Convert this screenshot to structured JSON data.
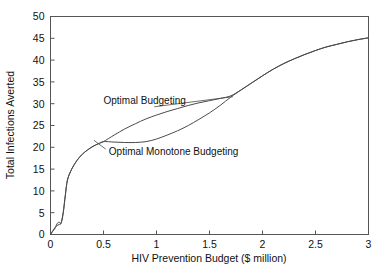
{
  "chart_data": {
    "type": "line",
    "title": "",
    "xlabel": "HIV Prevention Budget ($ million)",
    "ylabel": "Total Infections Averted",
    "xlim": [
      0,
      3
    ],
    "ylim": [
      0,
      50
    ],
    "xticks": [
      "0",
      "0.5",
      "1",
      "1.5",
      "2",
      "2.5",
      "3"
    ],
    "xtick_values": [
      0,
      0.5,
      1,
      1.5,
      2,
      2.5,
      3
    ],
    "yticks": [
      "0",
      "5",
      "10",
      "15",
      "20",
      "25",
      "30",
      "35",
      "40",
      "45",
      "50"
    ],
    "ytick_values": [
      0,
      5,
      10,
      15,
      20,
      25,
      30,
      35,
      40,
      45,
      50
    ],
    "grid": false,
    "legend": "annotations-inline",
    "series": [
      {
        "name": "Optimal Budgeting",
        "points": [
          [
            0.0,
            0.0
          ],
          [
            0.02,
            0.8
          ],
          [
            0.04,
            1.5
          ],
          [
            0.06,
            2.0
          ],
          [
            0.08,
            2.3
          ],
          [
            0.1,
            2.6
          ],
          [
            0.12,
            5.0
          ],
          [
            0.14,
            9.0
          ],
          [
            0.16,
            12.5
          ],
          [
            0.2,
            15.0
          ],
          [
            0.25,
            17.0
          ],
          [
            0.3,
            18.4
          ],
          [
            0.35,
            19.4
          ],
          [
            0.4,
            20.2
          ],
          [
            0.45,
            20.8
          ],
          [
            0.5,
            21.3
          ],
          [
            0.6,
            22.8
          ],
          [
            0.7,
            24.2
          ],
          [
            0.8,
            25.4
          ],
          [
            0.9,
            26.5
          ],
          [
            1.0,
            27.4
          ],
          [
            1.1,
            28.2
          ],
          [
            1.2,
            28.9
          ],
          [
            1.3,
            29.6
          ],
          [
            1.4,
            30.2
          ],
          [
            1.5,
            30.7
          ],
          [
            1.6,
            31.2
          ],
          [
            1.7,
            31.8
          ],
          [
            1.8,
            33.2
          ],
          [
            1.9,
            34.8
          ],
          [
            2.0,
            36.4
          ],
          [
            2.1,
            37.9
          ],
          [
            2.2,
            39.2
          ],
          [
            2.3,
            40.3
          ],
          [
            2.4,
            41.3
          ],
          [
            2.5,
            42.2
          ],
          [
            2.6,
            43.0
          ],
          [
            2.7,
            43.6
          ],
          [
            2.8,
            44.2
          ],
          [
            2.9,
            44.7
          ],
          [
            3.0,
            45.1
          ]
        ]
      },
      {
        "name": "Optimal Monotone Budgeting",
        "points": [
          [
            0.0,
            0.0
          ],
          [
            0.02,
            0.7
          ],
          [
            0.04,
            1.3
          ],
          [
            0.05,
            1.9
          ],
          [
            0.06,
            2.4
          ],
          [
            0.07,
            2.7
          ],
          [
            0.085,
            2.8
          ],
          [
            0.1,
            2.6
          ],
          [
            0.12,
            5.0
          ],
          [
            0.14,
            9.0
          ],
          [
            0.16,
            12.5
          ],
          [
            0.2,
            15.0
          ],
          [
            0.25,
            17.0
          ],
          [
            0.3,
            18.4
          ],
          [
            0.35,
            19.4
          ],
          [
            0.4,
            20.2
          ],
          [
            0.45,
            20.8
          ],
          [
            0.5,
            21.3
          ],
          [
            0.6,
            21.2
          ],
          [
            0.7,
            21.1
          ],
          [
            0.8,
            21.1
          ],
          [
            0.9,
            21.3
          ],
          [
            1.0,
            21.9
          ],
          [
            1.1,
            22.8
          ],
          [
            1.2,
            23.8
          ],
          [
            1.3,
            25.0
          ],
          [
            1.4,
            26.4
          ],
          [
            1.5,
            27.9
          ],
          [
            1.6,
            29.6
          ],
          [
            1.7,
            31.5
          ],
          [
            1.8,
            33.2
          ],
          [
            1.9,
            34.8
          ],
          [
            2.0,
            36.4
          ],
          [
            2.1,
            37.9
          ],
          [
            2.2,
            39.2
          ],
          [
            2.3,
            40.3
          ],
          [
            2.4,
            41.3
          ],
          [
            2.5,
            42.2
          ],
          [
            2.6,
            43.0
          ],
          [
            2.7,
            43.6
          ],
          [
            2.8,
            44.2
          ],
          [
            2.9,
            44.7
          ],
          [
            3.0,
            45.1
          ]
        ]
      }
    ],
    "annotations": [
      {
        "text": "Optimal Budgeting",
        "x": 0.5,
        "y": 30.0,
        "leader_from": [
          0.98,
          29.3
        ],
        "leader_to": [
          1.72,
          31.6
        ]
      },
      {
        "text": "Optimal Monotone Budgeting",
        "x": 0.55,
        "y": 18.2,
        "leader_from": [
          0.52,
          19.6
        ],
        "leader_to": [
          0.41,
          21.6
        ]
      }
    ]
  },
  "colors": {
    "curve": "#4a4a4a",
    "frame": "#555555",
    "text": "#111111",
    "background": "#ffffff"
  }
}
